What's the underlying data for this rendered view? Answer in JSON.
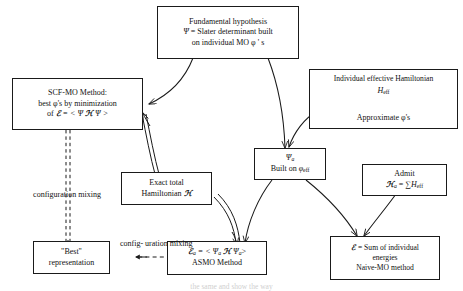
{
  "diagram": {
    "nodes": {
      "fundamental_hypothesis": {
        "line1": "Fundamental hypothesis",
        "line2_psi": "Ψ",
        "line2_rest": " = Slater determinant built",
        "line3": "on individual MO φ ' s"
      },
      "scf_mo": {
        "line1": "SCF-MO Method:",
        "line2": "best φ's by minimization",
        "line3_prefix": "of  ",
        "line3_E": "ℰ",
        "line3_mid": " = < Ψ ",
        "line3_H": "ℋ",
        "line3_suffix": " Ψ >"
      },
      "individual_effective_hamiltonian": {
        "line1": "Individual effective Hamiltonian",
        "line2_H": "H",
        "line2_sub": "eff",
        "line3": "Approximate φ's"
      },
      "psi_a": {
        "line1_psi": "Ψ",
        "line1_sub": "a",
        "line2_prefix": "Built on ",
        "line2_phi": "φ",
        "line2_sub": "eff"
      },
      "exact_total_hamiltonian": {
        "line1": "Exact total",
        "line2_prefix": "Hamiltonian ",
        "line2_H": "ℋ"
      },
      "admit": {
        "line1": "Admit",
        "line2_H": "ℋ",
        "line2_sub": "a",
        "line2_mid": " = ",
        "line2_sum": "∑",
        "line2_Heff": "H",
        "line2_Heff_sub": "eff"
      },
      "best_representation": {
        "line1": "\"Best\"",
        "line2": "representation"
      },
      "asmo": {
        "line1_E": "ℰ",
        "line1_Esub": "a",
        "line1_mid": " = < Ψ",
        "line1_psisub1": "a",
        "line1_H": " ℋ ",
        "line1_psi2": "Ψ",
        "line1_psisub2": "a",
        "line1_end": ">",
        "line2": "ASMO Method"
      },
      "naive_mo": {
        "line1_E": "ℰ",
        "line1_rest": " = Sum of individual",
        "line2": "energies",
        "line3": "Naive-MO method"
      }
    },
    "edge_labels": {
      "configuration_mixing_vertical": [
        "configuration",
        "mixing"
      ],
      "configuration_mixing_horizontal": [
        "config-",
        "uration",
        "mixing"
      ]
    },
    "page_bleed_text": "the same and show the way"
  }
}
